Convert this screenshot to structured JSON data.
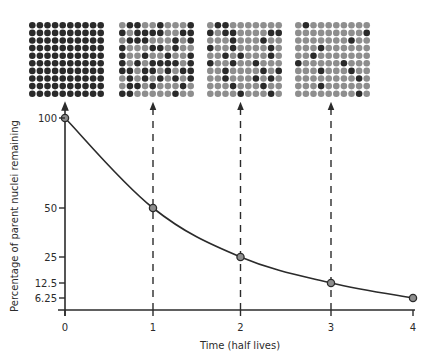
{
  "colors": {
    "decayed": "#8e8e8e",
    "parent": "#2a2a2a",
    "axis": "#2b2b2b",
    "curve": "#2b2b2b",
    "point_fill": "#8e8e8e"
  },
  "grids": [
    {
      "label": "t0",
      "dark": "all"
    },
    {
      "label": "t1",
      "dark": [
        [
          1,
          2,
          5,
          9
        ],
        [
          0,
          2,
          3,
          4,
          5,
          8,
          9
        ],
        [
          1,
          2,
          3,
          7,
          9
        ],
        [
          0,
          4,
          5,
          7
        ],
        [
          0,
          3,
          6,
          9
        ],
        [
          0,
          2,
          4,
          5,
          6,
          7,
          9
        ],
        [
          0,
          1,
          3,
          4,
          6,
          8,
          9
        ],
        [
          1,
          3,
          5,
          7,
          9
        ],
        [
          1,
          2,
          4,
          8
        ],
        [
          0,
          1,
          7
        ]
      ]
    },
    {
      "label": "t2",
      "dark": [
        [
          1,
          2
        ],
        [
          0,
          2,
          3,
          8,
          9
        ],
        [
          3,
          7
        ],
        [
          0,
          3,
          8
        ],
        [
          2,
          4,
          8
        ],
        [
          0,
          3,
          6
        ],
        [
          2,
          7,
          9
        ],
        [
          2,
          6,
          8
        ],
        [
          3,
          7
        ],
        [
          4,
          8
        ]
      ]
    },
    {
      "label": "t3",
      "dark": [
        [
          1
        ],
        [
          9
        ],
        [
          7
        ],
        [
          3
        ],
        [
          2
        ],
        [
          0,
          6
        ],
        [
          3,
          7
        ],
        [
          8
        ],
        [
          3
        ],
        [
          8
        ]
      ]
    }
  ],
  "chart_data": {
    "type": "line",
    "title": "",
    "xlabel": "Time (half lives)",
    "ylabel": "Percentage of parent nuclei remaining",
    "x": [
      0,
      1,
      2,
      3,
      4
    ],
    "values": [
      100,
      50,
      25,
      12.5,
      6.25
    ],
    "x_ticks": [
      "0",
      "1",
      "2",
      "3",
      "4"
    ],
    "y_ticks": [
      "100",
      "50",
      "25",
      "12.5",
      "6.25"
    ],
    "xlim": [
      0,
      4
    ],
    "ylim": [
      0,
      100
    ],
    "grid": false,
    "dashed_arrows_from_points_to_grids": [
      0,
      1,
      2,
      3
    ]
  }
}
